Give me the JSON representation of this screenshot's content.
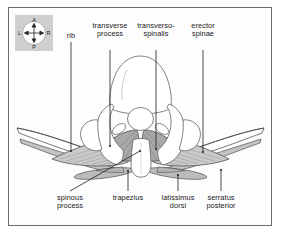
{
  "figure": {
    "frame_color": "#6b6b6b",
    "background_color": "#fdfdfd",
    "label_color": "#1a1a1a",
    "leader_line_color": "#2a2a2a",
    "outline_color": "#555555",
    "muscle_light_fill": "#cfcfcf",
    "muscle_mid_fill": "#b9b9b9",
    "muscle_dark_fill": "#a5a5a5",
    "bone_fill": "#ffffff"
  },
  "compass": {
    "name": "orientation-compass",
    "box_color": "#cfcfcf",
    "anterior": "A",
    "left": "L",
    "right": "R",
    "posterior": "P"
  },
  "labels": {
    "top": [
      {
        "id": "rib",
        "text": "rib"
      },
      {
        "id": "transverse-process",
        "text": "transverse\nprocess"
      },
      {
        "id": "transversospinalis",
        "text": "transverso-\nspinalis"
      },
      {
        "id": "erector-spinae",
        "text": "erector\nspinae"
      }
    ],
    "bottom": [
      {
        "id": "spinous-process",
        "text": "spinous\nprocess"
      },
      {
        "id": "trapezius",
        "text": "trapezius"
      },
      {
        "id": "latissimus-dorsi",
        "text": "latissimus\ndorsi"
      },
      {
        "id": "serratus-posterior",
        "text": "serratus\nposterior"
      }
    ]
  }
}
